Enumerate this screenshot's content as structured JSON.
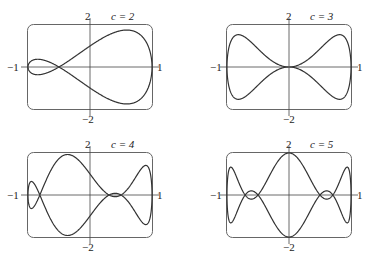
{
  "chart_data": [
    {
      "type": "line",
      "title": "c = 2",
      "c": 2,
      "param": "x = cos t, y = sin t + sin(c t)",
      "xlim": [
        -1,
        1
      ],
      "ylim": [
        -2,
        2
      ],
      "tick_labels": {
        "x_left": "−1",
        "x_right": "1",
        "y_top": "2",
        "y_bottom": "−2"
      },
      "grid": false,
      "legend": "none"
    },
    {
      "type": "line",
      "title": "c = 3",
      "c": 3,
      "param": "x = cos t, y = sin t + sin(c t)",
      "xlim": [
        -1,
        1
      ],
      "ylim": [
        -2,
        2
      ],
      "tick_labels": {
        "x_left": "−1",
        "x_right": "1",
        "y_top": "2",
        "y_bottom": "−2"
      },
      "grid": false,
      "legend": "none"
    },
    {
      "type": "line",
      "title": "c = 4",
      "c": 4,
      "param": "x = cos t, y = sin t + sin(c t)",
      "xlim": [
        -1,
        1
      ],
      "ylim": [
        -2,
        2
      ],
      "tick_labels": {
        "x_left": "−1",
        "x_right": "1",
        "y_top": "2",
        "y_bottom": "−2"
      },
      "grid": false,
      "legend": "none"
    },
    {
      "type": "line",
      "title": "c = 5",
      "c": 5,
      "param": "x = cos t, y = sin t + sin(c t)",
      "xlim": [
        -1,
        1
      ],
      "ylim": [
        -2,
        2
      ],
      "tick_labels": {
        "x_left": "−1",
        "x_right": "1",
        "y_top": "2",
        "y_bottom": "−2"
      },
      "grid": false,
      "legend": "none"
    }
  ],
  "panels": [
    {
      "c_label": "c = 2",
      "x_left": "−1",
      "x_right": "1",
      "y_top": "2",
      "y_bottom": "−2"
    },
    {
      "c_label": "c = 3",
      "x_left": "−1",
      "x_right": "1",
      "y_top": "2",
      "y_bottom": "−2"
    },
    {
      "c_label": "c = 4",
      "x_left": "−1",
      "x_right": "1",
      "y_top": "2",
      "y_bottom": "−2"
    },
    {
      "c_label": "c = 5",
      "x_left": "−1",
      "x_right": "1",
      "y_top": "2",
      "y_bottom": "−2"
    }
  ],
  "colors": {
    "curve": "#333333",
    "frame": "#666666",
    "axis": "#444444"
  }
}
